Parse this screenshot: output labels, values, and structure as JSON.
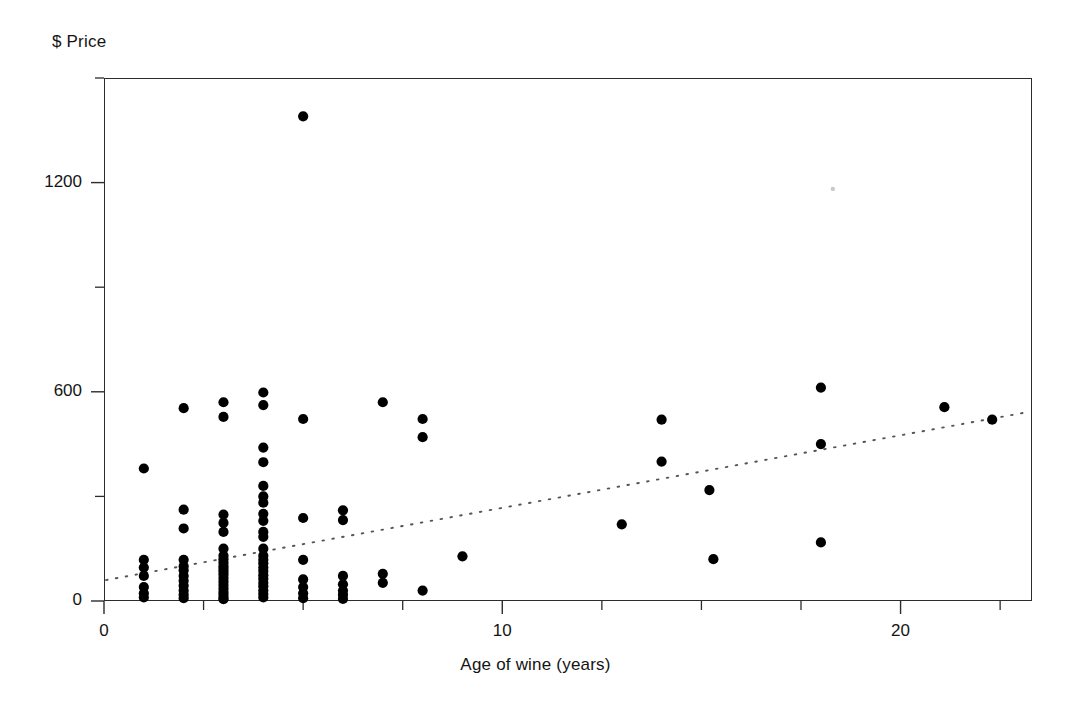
{
  "chart_data": {
    "type": "scatter",
    "title": "",
    "xlabel": "Age of wine (years)",
    "ylabel": "$ Price",
    "xlim": [
      0,
      23.3
    ],
    "ylim": [
      0,
      1500
    ],
    "x_major_ticks": [
      0,
      10,
      20
    ],
    "x_major_tick_labels": [
      "0",
      "10",
      "20"
    ],
    "x_minor_ticks": [
      2.5,
      5,
      7.5,
      12.5,
      15,
      17.5,
      22.5
    ],
    "y_major_ticks": [
      0,
      600,
      1200
    ],
    "y_major_tick_labels": [
      "0",
      "600",
      "1200"
    ],
    "y_minor_ticks": [
      300,
      900,
      1500
    ],
    "grid": false,
    "legend": false,
    "frame": "box",
    "marker": "filled-circle",
    "marker_color": "#000000",
    "trendline": {
      "style": "dotted",
      "color": "#555555",
      "x_start": 0.05,
      "y_start": 60,
      "x_end": 23.25,
      "y_end": 543
    },
    "points": [
      [
        1.0,
        380
      ],
      [
        1.0,
        118
      ],
      [
        1.0,
        96
      ],
      [
        1.0,
        72
      ],
      [
        1.0,
        40
      ],
      [
        1.0,
        22
      ],
      [
        1.0,
        10
      ],
      [
        2.0,
        553
      ],
      [
        2.0,
        262
      ],
      [
        2.0,
        208
      ],
      [
        2.0,
        118
      ],
      [
        2.0,
        100
      ],
      [
        2.0,
        88
      ],
      [
        2.0,
        72
      ],
      [
        2.0,
        58
      ],
      [
        2.0,
        44
      ],
      [
        2.0,
        30
      ],
      [
        2.0,
        18
      ],
      [
        2.0,
        8
      ],
      [
        3.0,
        570
      ],
      [
        3.0,
        528
      ],
      [
        3.0,
        248
      ],
      [
        3.0,
        224
      ],
      [
        3.0,
        198
      ],
      [
        3.0,
        150
      ],
      [
        3.0,
        130
      ],
      [
        3.0,
        120
      ],
      [
        3.0,
        110
      ],
      [
        3.0,
        100
      ],
      [
        3.0,
        92
      ],
      [
        3.0,
        84
      ],
      [
        3.0,
        76
      ],
      [
        3.0,
        66
      ],
      [
        3.0,
        56
      ],
      [
        3.0,
        46
      ],
      [
        3.0,
        36
      ],
      [
        3.0,
        26
      ],
      [
        3.0,
        18
      ],
      [
        3.0,
        10
      ],
      [
        3.0,
        5
      ],
      [
        4.0,
        598
      ],
      [
        4.0,
        562
      ],
      [
        4.0,
        440
      ],
      [
        4.0,
        398
      ],
      [
        4.0,
        330
      ],
      [
        4.0,
        300
      ],
      [
        4.0,
        282
      ],
      [
        4.0,
        250
      ],
      [
        4.0,
        230
      ],
      [
        4.0,
        198
      ],
      [
        4.0,
        184
      ],
      [
        4.0,
        150
      ],
      [
        4.0,
        130
      ],
      [
        4.0,
        118
      ],
      [
        4.0,
        108
      ],
      [
        4.0,
        96
      ],
      [
        4.0,
        86
      ],
      [
        4.0,
        74
      ],
      [
        4.0,
        64
      ],
      [
        4.0,
        52
      ],
      [
        4.0,
        42
      ],
      [
        4.0,
        30
      ],
      [
        4.0,
        20
      ],
      [
        4.0,
        10
      ],
      [
        5.0,
        1390
      ],
      [
        5.0,
        522
      ],
      [
        5.0,
        238
      ],
      [
        5.0,
        118
      ],
      [
        5.0,
        62
      ],
      [
        5.0,
        40
      ],
      [
        5.0,
        22
      ],
      [
        5.0,
        8
      ],
      [
        6.0,
        260
      ],
      [
        6.0,
        232
      ],
      [
        6.0,
        72
      ],
      [
        6.0,
        48
      ],
      [
        6.0,
        30
      ],
      [
        6.0,
        18
      ],
      [
        6.0,
        6
      ],
      [
        7.0,
        570
      ],
      [
        7.0,
        78
      ],
      [
        7.0,
        52
      ],
      [
        8.0,
        522
      ],
      [
        8.0,
        470
      ],
      [
        8.0,
        30
      ],
      [
        9.0,
        128
      ],
      [
        13.0,
        220
      ],
      [
        14.0,
        520
      ],
      [
        14.0,
        400
      ],
      [
        15.2,
        318
      ],
      [
        15.3,
        120
      ],
      [
        18.0,
        612
      ],
      [
        18.0,
        450
      ],
      [
        18.0,
        168
      ],
      [
        21.1,
        556
      ],
      [
        22.3,
        520
      ]
    ],
    "faint_specks": [
      [
        18.3,
        1182
      ]
    ]
  },
  "axis": {
    "y_title": "$ Price",
    "x_title": "Age of wine (years)"
  }
}
